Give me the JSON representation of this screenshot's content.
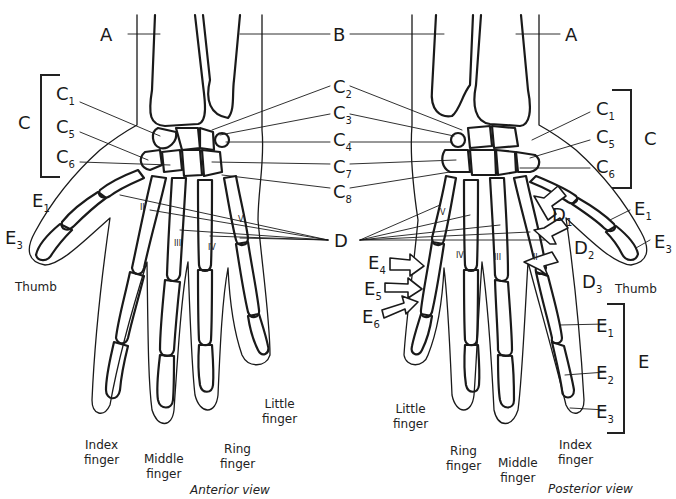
{
  "figure": {
    "views": {
      "anterior": "Anterior view",
      "posterior": "Posterior view"
    },
    "labels": {
      "A": "A",
      "B": "B",
      "C": "C",
      "D": "D",
      "E": "E",
      "C1": {
        "base": "C",
        "sub": "1"
      },
      "C2": {
        "base": "C",
        "sub": "2"
      },
      "C3": {
        "base": "C",
        "sub": "3"
      },
      "C4": {
        "base": "C",
        "sub": "4"
      },
      "C5": {
        "base": "C",
        "sub": "5"
      },
      "C6": {
        "base": "C",
        "sub": "6"
      },
      "C7": {
        "base": "C",
        "sub": "7"
      },
      "C8": {
        "base": "C",
        "sub": "8"
      },
      "D1": {
        "base": "D",
        "sub": "1"
      },
      "D2": {
        "base": "D",
        "sub": "2"
      },
      "D3": {
        "base": "D",
        "sub": "3"
      },
      "E1": {
        "base": "E",
        "sub": "1"
      },
      "E2": {
        "base": "E",
        "sub": "2"
      },
      "E3": {
        "base": "E",
        "sub": "3"
      },
      "E4": {
        "base": "E",
        "sub": "4"
      },
      "E5": {
        "base": "E",
        "sub": "5"
      },
      "E6": {
        "base": "E",
        "sub": "6"
      }
    },
    "fingers": {
      "thumb": "Thumb",
      "index": [
        "Index",
        "finger"
      ],
      "middle": [
        "Middle",
        "finger"
      ],
      "ring": [
        "Ring",
        "finger"
      ],
      "little": [
        "Little",
        "finger"
      ]
    },
    "metacarpal_numerals": [
      "I",
      "II",
      "III",
      "IV",
      "V"
    ],
    "colors": {
      "line": "#1a1a1a",
      "background": "#ffffff"
    }
  }
}
